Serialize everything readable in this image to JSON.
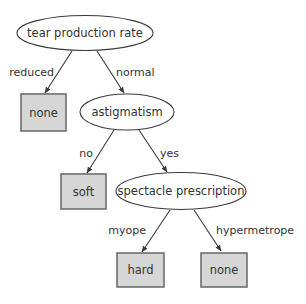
{
  "diagram": {
    "type": "decision-tree",
    "colors": {
      "line": "#3a3a3a",
      "leaf_fill": "#d6d6d6",
      "leaf_border": "#6e6e6e",
      "text": "#333333"
    },
    "nodes": {
      "root": {
        "label": "tear production rate"
      },
      "astigmatism": {
        "label": "astigmatism"
      },
      "spectacle": {
        "label": "spectacle prescription"
      }
    },
    "leaves": {
      "reduced_none": {
        "label": "none"
      },
      "no_soft": {
        "label": "soft"
      },
      "myope_hard": {
        "label": "hard"
      },
      "hypermetrope_none": {
        "label": "none"
      }
    },
    "edges": {
      "root_reduced": {
        "label": "reduced"
      },
      "root_normal": {
        "label": "normal"
      },
      "astig_no": {
        "label": "no"
      },
      "astig_yes": {
        "label": "yes"
      },
      "spec_myope": {
        "label": "myope"
      },
      "spec_hypermetrope": {
        "label": "hypermetrope"
      }
    }
  }
}
